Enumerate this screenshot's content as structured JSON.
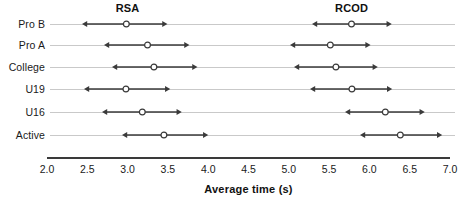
{
  "chart_data": {
    "type": "scatter",
    "title": "",
    "subtitle": "",
    "xlabel": "Average time (s)",
    "ylabel": "",
    "xlim": [
      2.0,
      7.0
    ],
    "grid": false,
    "legend_position": "none",
    "orientation": "horizontal",
    "marker": "open-circle",
    "error_bar_style": "double-headed-arrow",
    "annotations": [
      {
        "text": "RSA",
        "x": 3.0,
        "row": "Pro B",
        "placement": "above-first-row"
      },
      {
        "text": "RCOD",
        "x": 5.78,
        "row": "Pro B",
        "placement": "above-first-row"
      }
    ],
    "xticks": [
      2.0,
      2.5,
      3.0,
      3.5,
      4.0,
      4.5,
      5.0,
      5.5,
      6.0,
      6.5,
      7.0
    ],
    "xticklabels": [
      "2.0",
      "2.5",
      "3.0",
      "3.5",
      "4.0",
      "4.5",
      "5.0",
      "5.5",
      "6.0",
      "6.5",
      "7.0"
    ],
    "categories": [
      "Pro B",
      "Pro A",
      "College",
      "U19",
      "U16",
      "Active"
    ],
    "series": [
      {
        "name": "RSA",
        "values": [
          2.98,
          3.25,
          3.33,
          2.98,
          3.18,
          3.45
        ],
        "lower": [
          2.43,
          2.71,
          2.81,
          2.46,
          2.68,
          2.93
        ],
        "upper": [
          3.49,
          3.77,
          3.87,
          3.53,
          3.67,
          4.0
        ]
      },
      {
        "name": "RCOD",
        "values": [
          5.78,
          5.51,
          5.58,
          5.78,
          6.2,
          6.38
        ],
        "lower": [
          5.29,
          5.01,
          5.06,
          5.26,
          5.7,
          5.88
        ],
        "upper": [
          6.28,
          6.01,
          6.1,
          6.28,
          6.69,
          6.9
        ]
      }
    ]
  },
  "colors": {
    "marker_stroke": "#3a3a3a",
    "marker_fill": "#ffffff",
    "interval_line": "#3a3a3a",
    "row_rule": "#c9c9c9",
    "axis": "#3a3a3a",
    "text": "#1a1a1a",
    "background": "#ffffff"
  }
}
